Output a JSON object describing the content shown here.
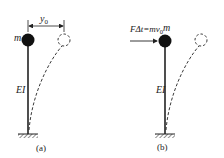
{
  "figure_a": {
    "caption": "(a)",
    "mass_label": "m",
    "stiffness_label": "EI",
    "displacement_label": "y",
    "displacement_subscript": "0"
  },
  "figure_b": {
    "caption": "(b)",
    "mass_label": "m",
    "stiffness_label": "EI",
    "impulse_label": "FΔt=mv",
    "impulse_subscript": "0"
  },
  "colors": {
    "line": "#222222",
    "background": "#ffffff"
  }
}
